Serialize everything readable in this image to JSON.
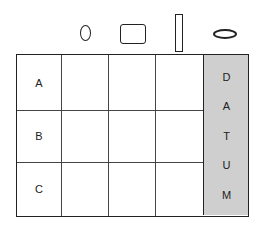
{
  "header_shapes": [
    {
      "name": "circle",
      "type": "ellipse-vertical"
    },
    {
      "name": "rectangle",
      "type": "rounded-rect"
    },
    {
      "name": "tall-bar",
      "type": "tall-rect"
    },
    {
      "name": "flat-ellipse",
      "type": "ellipse-horizontal"
    }
  ],
  "rows": [
    {
      "label": "A"
    },
    {
      "label": "B"
    },
    {
      "label": "C"
    }
  ],
  "datum_column": {
    "letters": [
      "D",
      "A",
      "T",
      "U",
      "M"
    ],
    "fill_color": "#cfcfcf"
  }
}
